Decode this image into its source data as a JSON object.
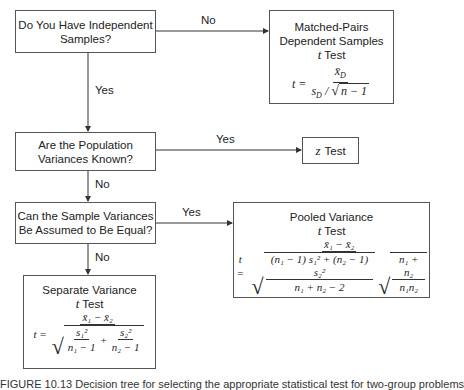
{
  "nodes": {
    "independent": {
      "line1": "Do You Have Independent",
      "line2": "Samples?"
    },
    "matched": {
      "line1": "Matched-Pairs",
      "line2": "Dependent Samples",
      "line3_var": "t",
      "line3": "Test",
      "formula": {
        "lhs": "t =",
        "num": "x̄",
        "num_sub": "D",
        "den_s": "s",
        "den_s_sub": "D",
        "den_slash": "/",
        "den_root": "n − 1"
      }
    },
    "pop_var": {
      "line1": "Are the Population",
      "line2": "Variances Known?"
    },
    "z_test": {
      "var": "z",
      "label": "Test"
    },
    "sample_var": {
      "line1": "Can the Sample Variances",
      "line2": "Be Assumed to Be Equal?"
    },
    "pooled": {
      "line1": "Pooled Variance",
      "line2_var": "t",
      "line2": "Test",
      "formula": {
        "lhs": "t =",
        "num": "x̄₁ − x̄₂",
        "den_left_num": "(n₁ − 1) s₁² + (n₂ − 1) s₂²",
        "den_left_den": "n₁ + n₂ − 2",
        "den_right_num": "n₁ + n₂",
        "den_right_den": "n₁n₂"
      }
    },
    "separate": {
      "line1": "Separate Variance",
      "line2_var": "t",
      "line2": "Test",
      "formula": {
        "lhs": "t =",
        "num": "x̄₁ − x̄₂",
        "t1_num": "s₁²",
        "t1_den": "n₁ − 1",
        "plus": "+",
        "t2_num": "s₂²",
        "t2_den": "n₂ − 1"
      }
    }
  },
  "edges": {
    "independent_no": "No",
    "independent_yes": "Yes",
    "pop_var_yes": "Yes",
    "pop_var_no": "No",
    "sample_var_yes": "Yes",
    "sample_var_no": "No"
  },
  "caption": "FIGURE 10.13  Decision tree for selecting the appropriate statistical test for two-group problems"
}
